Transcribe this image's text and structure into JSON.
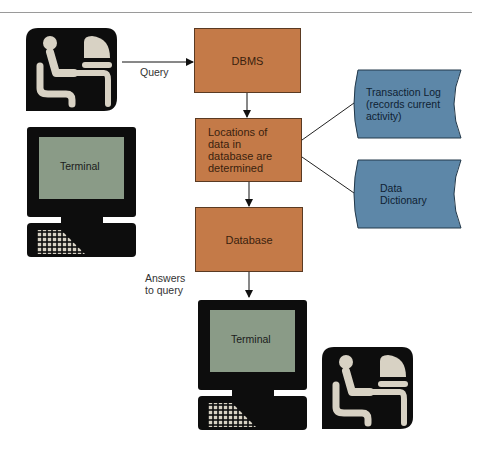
{
  "diagram": {
    "title": "",
    "colors": {
      "process_box": "#c47a48",
      "document_shape": "#5d87a8",
      "terminal_screen": "#8a9b87",
      "icon_dark": "#0d0d0d",
      "icon_figure": "#d8d2c4"
    },
    "nodes": {
      "user_top": {
        "type": "icon",
        "icon": "person-at-computer-icon"
      },
      "terminal_top": {
        "type": "terminal",
        "label": "Terminal"
      },
      "dbms": {
        "type": "process",
        "label": "DBMS"
      },
      "locations": {
        "type": "process",
        "label_lines": [
          "Locations of",
          "data in",
          "database are",
          "determined"
        ]
      },
      "transaction_log": {
        "type": "document",
        "label_lines": [
          "Transaction Log",
          "(records current",
          "activity)"
        ]
      },
      "data_dictionary": {
        "type": "document",
        "label_lines": [
          "Data",
          "Dictionary"
        ]
      },
      "database": {
        "type": "process",
        "label": "Database"
      },
      "terminal_bottom": {
        "type": "terminal",
        "label": "Terminal"
      },
      "user_bottom": {
        "type": "icon",
        "icon": "person-at-computer-icon"
      }
    },
    "edges": [
      {
        "from": "user_top",
        "to": "dbms",
        "label": "Query",
        "arrow": true
      },
      {
        "from": "dbms",
        "to": "locations",
        "label": "",
        "arrow": true
      },
      {
        "from": "locations",
        "to": "transaction_log",
        "label": "",
        "arrow": false
      },
      {
        "from": "locations",
        "to": "data_dictionary",
        "label": "",
        "arrow": false
      },
      {
        "from": "locations",
        "to": "database",
        "label": "",
        "arrow": true
      },
      {
        "from": "database",
        "to": "terminal_bottom",
        "label": "Answers to query",
        "arrow": true
      }
    ],
    "edge_labels": {
      "query": "Query",
      "answers_line1": "Answers",
      "answers_line2": "to query"
    }
  }
}
